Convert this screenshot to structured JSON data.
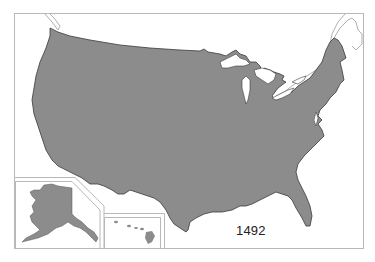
{
  "map": {
    "title": "United States outline map",
    "year_label": "1492",
    "regions": [
      {
        "name": "Contiguous United States",
        "fill": "#8c8c8c"
      },
      {
        "name": "Alaska (inset)",
        "fill": "#8c8c8c"
      },
      {
        "name": "Hawaii (inset)",
        "fill": "#8c8c8c"
      }
    ],
    "water_features": [
      "Great Lakes",
      "Saint Lawrence River"
    ],
    "colors": {
      "land": "#8c8c8c",
      "land_outline": "#3a3a3a",
      "water_background": "#ffffff",
      "frame": "#b8b8b8",
      "neighbor_outline": "#9a9a9a"
    }
  }
}
